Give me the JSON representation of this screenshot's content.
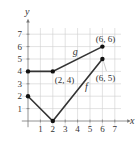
{
  "chart_data": {
    "type": "line",
    "title": "",
    "xlabel": "x",
    "ylabel": "y",
    "xlim": [
      -0.5,
      7.5
    ],
    "ylim": [
      -0.5,
      7.5
    ],
    "grid": true,
    "x_ticks": [
      "1",
      "2",
      "3",
      "4",
      "5",
      "6",
      "7"
    ],
    "y_ticks": [
      "1",
      "2",
      "3",
      "4",
      "5",
      "6",
      "7"
    ],
    "series": [
      {
        "name": "g",
        "points": [
          [
            0,
            4
          ],
          [
            2,
            4
          ],
          [
            6,
            6
          ]
        ],
        "label_pos": [
          3.6,
          5.3
        ]
      },
      {
        "name": "f",
        "points": [
          [
            0,
            2
          ],
          [
            2,
            0
          ],
          [
            6,
            5
          ]
        ],
        "label_pos": [
          4.6,
          2.5
        ]
      }
    ],
    "annotations": [
      {
        "text": "(2, 4)",
        "point": [
          2,
          4
        ]
      },
      {
        "text": "(6, 6)",
        "point": [
          6,
          6
        ]
      },
      {
        "text": "(6, 5)",
        "point": [
          6,
          5
        ]
      }
    ],
    "colors": {
      "line": "#333333",
      "grid": "#cfcfcf",
      "axis": "#777777"
    }
  }
}
